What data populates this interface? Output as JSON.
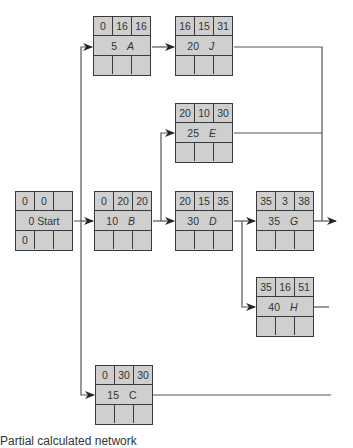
{
  "diagram": {
    "type": "activity-on-node network",
    "nodes": {
      "start": {
        "es": "0",
        "dur_ef": "0",
        "ef": "",
        "label": "0 Start",
        "ls": "0"
      },
      "A": {
        "es": "0",
        "ft": "16",
        "tf": "16",
        "duration": "5",
        "name": "A"
      },
      "J": {
        "es": "16",
        "ft": "15",
        "tf": "31",
        "duration": "20",
        "name": "J"
      },
      "E": {
        "es": "20",
        "ft": "10",
        "tf": "30",
        "duration": "25",
        "name": "E"
      },
      "B": {
        "es": "0",
        "ft": "20",
        "tf": "20",
        "duration": "10",
        "name": "B"
      },
      "D": {
        "es": "20",
        "ft": "15",
        "tf": "35",
        "duration": "30",
        "name": "D"
      },
      "G": {
        "es": "35",
        "ft": "3",
        "tf": "38",
        "duration": "35",
        "name": "G"
      },
      "H": {
        "es": "35",
        "ft": "16",
        "tf": "51",
        "duration": "40",
        "name": "H"
      },
      "C": {
        "es": "0",
        "ft": "30",
        "tf": "30",
        "duration": "15",
        "name": "C"
      }
    },
    "edges": [
      [
        "Start",
        "A"
      ],
      [
        "Start",
        "B"
      ],
      [
        "Start",
        "C"
      ],
      [
        "A",
        "J"
      ],
      [
        "B",
        "E"
      ],
      [
        "B",
        "D"
      ],
      [
        "D",
        "G"
      ],
      [
        "D",
        "H"
      ],
      [
        "J",
        "out-right"
      ],
      [
        "E",
        "out-right"
      ],
      [
        "G",
        "out-right"
      ],
      [
        "H",
        "out-right"
      ],
      [
        "C",
        "out-right"
      ]
    ],
    "colors": {
      "node_fill": "#cfcfcf",
      "node_border": "#3a3a3a",
      "line": "#555555"
    }
  },
  "caption": "Partial calculated network"
}
